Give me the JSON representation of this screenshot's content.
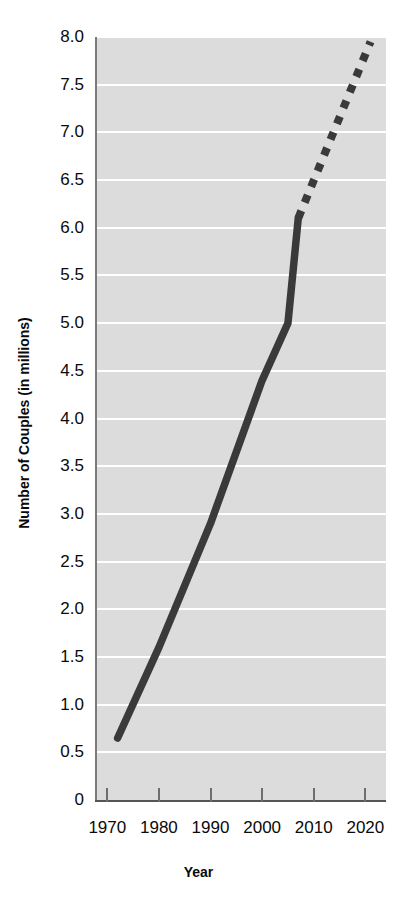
{
  "chart_data": {
    "type": "line",
    "title": "",
    "xlabel": "Year",
    "ylabel": "Number of Couples (in millions)",
    "xlim": [
      1968,
      2024
    ],
    "ylim": [
      0,
      8.0
    ],
    "grid": true,
    "legend": "none",
    "x_ticks": [
      "1970",
      "1980",
      "1990",
      "2000",
      "2010",
      "2020"
    ],
    "x_tick_values": [
      1970,
      1980,
      1990,
      2000,
      2010,
      2020
    ],
    "y_ticks": [
      "0",
      "0.5",
      "1.0",
      "1.5",
      "2.0",
      "2.5",
      "3.0",
      "3.5",
      "4.0",
      "4.5",
      "5.0",
      "5.5",
      "6.0",
      "6.5",
      "7.0",
      "7.5",
      "8.0"
    ],
    "y_tick_values": [
      0,
      0.5,
      1.0,
      1.5,
      2.0,
      2.5,
      3.0,
      3.5,
      4.0,
      4.5,
      5.0,
      5.5,
      6.0,
      6.5,
      7.0,
      7.5,
      8.0
    ],
    "series": [
      {
        "name": "Observed (solid)",
        "style": "solid",
        "color": "#3a3a3a",
        "x": [
          1972,
          1980,
          1990,
          2000,
          2005,
          2007
        ],
        "values": [
          0.65,
          1.6,
          2.9,
          4.4,
          5.0,
          6.1
        ]
      },
      {
        "name": "Projected (dotted)",
        "style": "dotted",
        "color": "#3a3a3a",
        "x": [
          2007,
          2021
        ],
        "values": [
          6.1,
          7.95
        ]
      }
    ]
  },
  "axis": {
    "x_title": "Year",
    "y_title": "Number of Couples (in millions)"
  },
  "slivers": {
    "top": "",
    "bottom": ""
  },
  "colors": {
    "line": "#3a3a3a",
    "plot_background": "#dcdcdc",
    "gridline": "#ffffff",
    "axis": "#555555",
    "text": "#0a0a0a",
    "page_background": "#ffffff"
  }
}
